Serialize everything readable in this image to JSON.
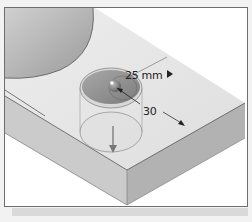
{
  "viewport": {
    "title": "Hole feature preview",
    "dimensions": {
      "diameter_label": "25 mm",
      "distance_label": "30"
    },
    "icons": {
      "dimension_menu": "play-arrow-icon",
      "center_handle": "sphere-handle-icon",
      "depth_arrow": "down-arrow-icon"
    },
    "colors": {
      "body_top": "#e6e6e6",
      "body_front": "#c8c8c8",
      "body_side": "#b4b4b4",
      "hole_preview": "#8a8a8a",
      "border": "#6e6e6e"
    }
  }
}
